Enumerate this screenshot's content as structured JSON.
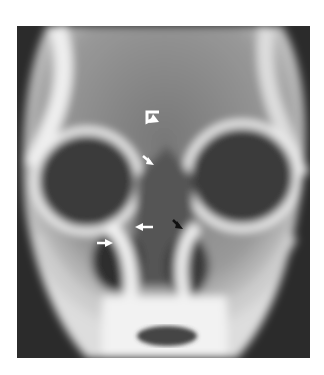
{
  "figure": {
    "type": "radiograph",
    "annotations": [
      {
        "name": "curved-arrow",
        "color": "#ffffff",
        "x": 153,
        "y": 115
      },
      {
        "name": "arrow-down-right",
        "color": "#ffffff",
        "x": 150,
        "y": 161
      },
      {
        "name": "arrow-left",
        "color": "#ffffff",
        "x": 150,
        "y": 227
      },
      {
        "name": "arrow-right",
        "color": "#ffffff",
        "x": 108,
        "y": 243
      },
      {
        "name": "arrow-down-right-black",
        "color": "#111111",
        "x": 178,
        "y": 226
      }
    ]
  },
  "colors": {
    "background": "#ffffff",
    "film_dark": "#2a2a2a",
    "bone": "#e8e8e8"
  }
}
